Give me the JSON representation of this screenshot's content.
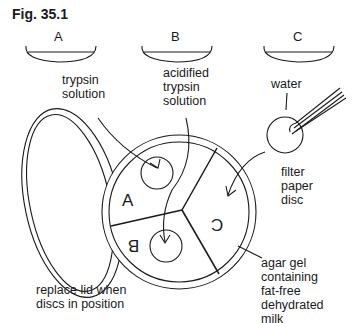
{
  "figure": {
    "title": "Fig. 35.1"
  },
  "dishes": [
    {
      "label": "A",
      "contents": "trypsin\nsolution"
    },
    {
      "label": "B",
      "contents": "acidified\ntrypsin\nsolution"
    },
    {
      "label": "C",
      "contents": "water"
    }
  ],
  "plate": {
    "sectors": [
      "A",
      "B",
      "C"
    ],
    "disc_label": "filter\npaper\ndisc",
    "agar_label": "agar gel\ncontaining\nfat-free\ndehydrated\nmilk",
    "lid_label": "replace lid when\ndiscs in position"
  },
  "colors": {
    "line": "#1a1a1a",
    "background": "#ffffff"
  }
}
